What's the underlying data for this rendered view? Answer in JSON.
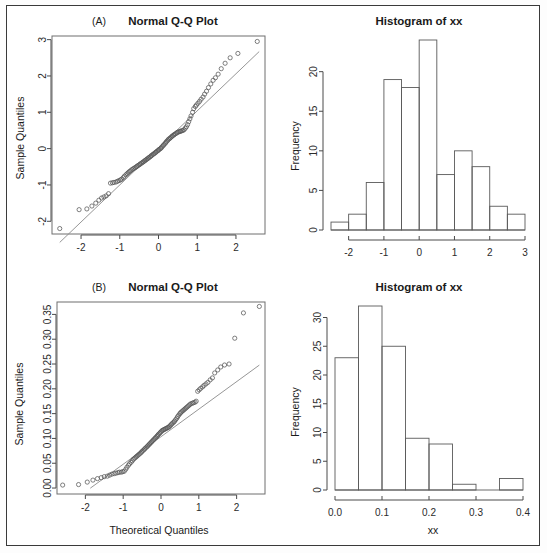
{
  "figure": {
    "background": "#ffffff",
    "border_color": "#3a3a3a",
    "point_color": "#555555",
    "line_color": "#8a8a8a"
  },
  "panels": {
    "a_qq": {
      "letter": "(A)",
      "title": "Normal Q-Q Plot",
      "ylabel": "Sample Quantiles",
      "xlabel": ""
    },
    "a_hist": {
      "title": "Histogram of xx",
      "ylabel": "Frequency",
      "xlabel": ""
    },
    "b_qq": {
      "letter": "(B)",
      "title": "Normal Q-Q Plot",
      "ylabel": "Sample Quantiles",
      "xlabel": "Theoretical Quantiles"
    },
    "b_hist": {
      "title": "Histogram of xx",
      "ylabel": "Frequency",
      "xlabel": "xx"
    }
  },
  "chart_data": [
    {
      "id": "a_qq",
      "type": "scatter",
      "title": "Normal Q-Q Plot",
      "panel_label": "(A)",
      "xlabel": "",
      "ylabel": "Sample Quantiles",
      "xlim": [
        -2.75,
        2.75
      ],
      "ylim": [
        -2.35,
        3.1
      ],
      "xticks": [
        -2,
        -1,
        0,
        1,
        2
      ],
      "yticks": [
        -2,
        -1,
        0,
        1,
        2,
        3
      ],
      "grid": false,
      "legend": "none",
      "reference_line": {
        "slope": 1.02,
        "intercept": 0.02,
        "x_from": -2.55,
        "x_to": 2.6
      },
      "x": [
        -2.55,
        -2.05,
        -1.85,
        -1.72,
        -1.62,
        -1.54,
        -1.47,
        -1.41,
        -1.35,
        -1.29,
        -1.24,
        -1.19,
        -1.15,
        -1.1,
        -1.06,
        -1.02,
        -0.98,
        -0.95,
        -0.91,
        -0.88,
        -0.84,
        -0.81,
        -0.78,
        -0.75,
        -0.72,
        -0.69,
        -0.66,
        -0.63,
        -0.6,
        -0.57,
        -0.55,
        -0.52,
        -0.49,
        -0.47,
        -0.44,
        -0.41,
        -0.39,
        -0.36,
        -0.34,
        -0.31,
        -0.29,
        -0.26,
        -0.24,
        -0.21,
        -0.19,
        -0.17,
        -0.14,
        -0.12,
        -0.09,
        -0.07,
        -0.05,
        -0.02,
        0.0,
        0.02,
        0.05,
        0.07,
        0.09,
        0.12,
        0.14,
        0.17,
        0.19,
        0.21,
        0.24,
        0.26,
        0.29,
        0.31,
        0.34,
        0.36,
        0.39,
        0.41,
        0.44,
        0.47,
        0.49,
        0.52,
        0.55,
        0.57,
        0.6,
        0.63,
        0.66,
        0.69,
        0.72,
        0.75,
        0.78,
        0.81,
        0.84,
        0.88,
        0.91,
        0.95,
        0.98,
        1.02,
        1.06,
        1.1,
        1.15,
        1.19,
        1.24,
        1.29,
        1.35,
        1.41,
        1.47,
        1.54,
        1.62,
        1.72,
        1.85,
        2.05,
        2.55
      ],
      "y": [
        -2.2,
        -1.68,
        -1.66,
        -1.58,
        -1.5,
        -1.42,
        -1.36,
        -1.33,
        -1.3,
        -1.24,
        -0.95,
        -0.94,
        -0.93,
        -0.92,
        -0.9,
        -0.88,
        -0.86,
        -0.84,
        -0.8,
        -0.76,
        -0.72,
        -0.69,
        -0.66,
        -0.63,
        -0.61,
        -0.58,
        -0.56,
        -0.54,
        -0.52,
        -0.5,
        -0.48,
        -0.46,
        -0.44,
        -0.42,
        -0.4,
        -0.38,
        -0.36,
        -0.34,
        -0.32,
        -0.3,
        -0.28,
        -0.26,
        -0.24,
        -0.22,
        -0.2,
        -0.18,
        -0.16,
        -0.14,
        -0.12,
        -0.1,
        -0.08,
        -0.06,
        -0.04,
        -0.02,
        0.0,
        0.02,
        0.05,
        0.08,
        0.11,
        0.14,
        0.17,
        0.2,
        0.23,
        0.26,
        0.28,
        0.3,
        0.33,
        0.35,
        0.37,
        0.39,
        0.41,
        0.43,
        0.45,
        0.46,
        0.47,
        0.48,
        0.49,
        0.5,
        0.52,
        0.56,
        0.6,
        0.66,
        0.74,
        0.82,
        0.9,
        1.0,
        1.1,
        1.16,
        1.2,
        1.25,
        1.3,
        1.36,
        1.42,
        1.5,
        1.58,
        1.68,
        1.78,
        1.88,
        1.95,
        2.05,
        2.2,
        2.35,
        2.5,
        2.62,
        2.95
      ]
    },
    {
      "id": "a_hist",
      "type": "bar",
      "title": "Histogram of xx",
      "xlabel": "",
      "ylabel": "Frequency",
      "bin_edges": [
        -2.5,
        -2.0,
        -1.5,
        -1.0,
        -0.5,
        0.0,
        0.5,
        1.0,
        1.5,
        2.0,
        2.5,
        3.0
      ],
      "categories": [
        "-2.5:-2.0",
        "-2.0:-1.5",
        "-1.5:-1.0",
        "-1.0:-0.5",
        "-0.5:0.0",
        "0.0:0.5",
        "0.5:1.0",
        "1.0:1.5",
        "1.5:2.0",
        "2.0:2.5",
        "2.5:3.0"
      ],
      "values": [
        1,
        2,
        6,
        19,
        18,
        24,
        7,
        10,
        8,
        3,
        2
      ],
      "xlim": [
        -2.5,
        3.0
      ],
      "ylim": [
        0,
        24
      ],
      "xticks": [
        -2,
        -1,
        0,
        1,
        2,
        3
      ],
      "yticks": [
        0,
        5,
        10,
        15,
        20
      ],
      "grid": false,
      "legend": "none"
    },
    {
      "id": "b_qq",
      "type": "scatter",
      "title": "Normal Q-Q Plot",
      "panel_label": "(B)",
      "xlabel": "Theoretical Quantiles",
      "ylabel": "Sample Quantiles",
      "xlim": [
        -2.75,
        2.75
      ],
      "ylim": [
        -0.012,
        0.375
      ],
      "xticks": [
        -2,
        -1,
        0,
        1,
        2
      ],
      "yticks": [
        0.0,
        0.05,
        0.1,
        0.15,
        0.2,
        0.25,
        0.3,
        0.35
      ],
      "ytick_labels": [
        "0.00",
        "0.05",
        "0.10",
        "0.15",
        "0.20",
        "0.25",
        "0.30",
        "0.35"
      ],
      "grid": false,
      "legend": "none",
      "reference_line": {
        "slope": 0.0555,
        "intercept": 0.1035,
        "x_from": -1.87,
        "x_to": 2.6
      },
      "x": [
        -2.6,
        -2.18,
        -1.95,
        -1.8,
        -1.68,
        -1.58,
        -1.5,
        -1.42,
        -1.36,
        -1.3,
        -1.24,
        -1.19,
        -1.14,
        -1.1,
        -1.05,
        -1.01,
        -0.97,
        -0.93,
        -0.9,
        -0.86,
        -0.83,
        -0.79,
        -0.76,
        -0.73,
        -0.7,
        -0.67,
        -0.64,
        -0.61,
        -0.58,
        -0.55,
        -0.52,
        -0.5,
        -0.47,
        -0.44,
        -0.42,
        -0.39,
        -0.36,
        -0.34,
        -0.31,
        -0.29,
        -0.26,
        -0.24,
        -0.21,
        -0.19,
        -0.16,
        -0.14,
        -0.11,
        -0.09,
        -0.07,
        -0.04,
        -0.02,
        0.01,
        0.03,
        0.06,
        0.08,
        0.11,
        0.13,
        0.16,
        0.18,
        0.21,
        0.23,
        0.26,
        0.28,
        0.31,
        0.34,
        0.36,
        0.39,
        0.42,
        0.44,
        0.47,
        0.5,
        0.52,
        0.55,
        0.58,
        0.61,
        0.64,
        0.67,
        0.7,
        0.73,
        0.76,
        0.79,
        0.83,
        0.86,
        0.9,
        0.93,
        0.97,
        1.01,
        1.05,
        1.1,
        1.14,
        1.19,
        1.24,
        1.3,
        1.36,
        1.42,
        1.5,
        1.58,
        1.68,
        1.8,
        1.95,
        2.18,
        2.6
      ],
      "y": [
        0.006,
        0.007,
        0.012,
        0.016,
        0.019,
        0.021,
        0.023,
        0.024,
        0.026,
        0.028,
        0.029,
        0.03,
        0.031,
        0.032,
        0.032,
        0.033,
        0.034,
        0.038,
        0.042,
        0.046,
        0.049,
        0.052,
        0.055,
        0.058,
        0.06,
        0.062,
        0.064,
        0.066,
        0.068,
        0.07,
        0.072,
        0.074,
        0.076,
        0.078,
        0.08,
        0.082,
        0.084,
        0.086,
        0.088,
        0.09,
        0.092,
        0.094,
        0.096,
        0.098,
        0.1,
        0.102,
        0.104,
        0.106,
        0.108,
        0.11,
        0.112,
        0.114,
        0.116,
        0.117,
        0.118,
        0.119,
        0.12,
        0.121,
        0.122,
        0.123,
        0.125,
        0.127,
        0.129,
        0.131,
        0.133,
        0.135,
        0.138,
        0.141,
        0.144,
        0.147,
        0.15,
        0.152,
        0.154,
        0.156,
        0.158,
        0.16,
        0.162,
        0.164,
        0.166,
        0.168,
        0.17,
        0.171,
        0.172,
        0.173,
        0.175,
        0.195,
        0.198,
        0.201,
        0.204,
        0.207,
        0.21,
        0.213,
        0.218,
        0.222,
        0.232,
        0.238,
        0.244,
        0.248,
        0.25,
        0.302,
        0.353,
        0.366
      ]
    },
    {
      "id": "b_hist",
      "type": "bar",
      "title": "Histogram of xx",
      "xlabel": "xx",
      "ylabel": "Frequency",
      "bin_edges": [
        0.0,
        0.05,
        0.1,
        0.15,
        0.2,
        0.25,
        0.3,
        0.35,
        0.4
      ],
      "categories": [
        "0.00:0.05",
        "0.05:0.10",
        "0.10:0.15",
        "0.15:0.20",
        "0.20:0.25",
        "0.25:0.30",
        "0.30:0.35",
        "0.35:0.40"
      ],
      "values": [
        23,
        32,
        25,
        9,
        8,
        1,
        0,
        2
      ],
      "xlim": [
        0.0,
        0.4
      ],
      "ylim": [
        0,
        32
      ],
      "xticks": [
        0.0,
        0.1,
        0.2,
        0.3,
        0.4
      ],
      "xtick_labels": [
        "0.0",
        "0.1",
        "0.2",
        "0.3",
        "0.4"
      ],
      "yticks": [
        0,
        5,
        10,
        15,
        20,
        25,
        30
      ],
      "grid": false,
      "legend": "none"
    }
  ]
}
